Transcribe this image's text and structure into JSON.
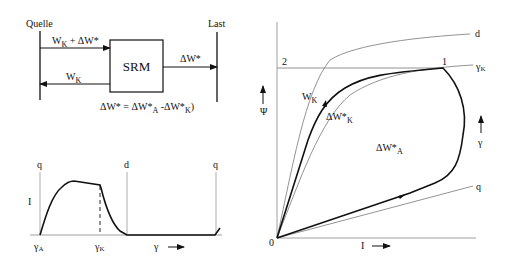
{
  "block_diagram": {
    "source_label": "Quelle",
    "load_label": "Last",
    "box_label": "SRM",
    "top_arrow_label": "W",
    "top_arrow_sub": "K",
    "top_arrow_rest": " + ΔW*",
    "bottom_arrow_label": "W",
    "bottom_arrow_sub": "K",
    "output_arrow_label": "ΔW*",
    "equation_a": "ΔW* = ΔW*",
    "equation_a_sub": "A",
    "equation_b": " -ΔW*",
    "equation_b_sub": "K",
    "equation_end": ")"
  },
  "current_plot": {
    "left_axis_label": "q",
    "mid_axis_label": "d",
    "right_axis_label": "q",
    "y_label": "I",
    "x_start": "γ",
    "x_start_sub": "A",
    "x_mid": "γ",
    "x_mid_sub": "K",
    "x_axis_label": "γ"
  },
  "flux_plot": {
    "y_label": "Ψ",
    "x_label": "I",
    "origin_label": "0",
    "point_1": "1",
    "point_2": "2",
    "curve_d": "d",
    "curve_gk": "γ",
    "curve_gk_sub": "K",
    "curve_q": "q",
    "gamma_arrow_label": "γ",
    "wk_label": "W",
    "wk_sub": "K",
    "dwk_label": "ΔW*",
    "dwk_sub": "K",
    "dwa_label": "ΔW*",
    "dwa_sub": "A"
  }
}
